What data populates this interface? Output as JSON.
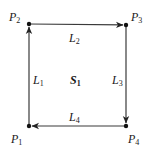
{
  "diagram": {
    "type": "directed-cycle",
    "region": {
      "name": "S",
      "sub": "1",
      "x": 77,
      "y": 80
    },
    "points": [
      {
        "id": "P1",
        "name": "P",
        "sub": "1",
        "x": 29,
        "y": 126,
        "label_x": 11,
        "label_y": 143
      },
      {
        "id": "P2",
        "name": "P",
        "sub": "2",
        "x": 29,
        "y": 24,
        "label_x": 9,
        "label_y": 21
      },
      {
        "id": "P3",
        "name": "P",
        "sub": "3",
        "x": 126,
        "y": 25,
        "label_x": 131,
        "label_y": 21
      },
      {
        "id": "P4",
        "name": "P",
        "sub": "4",
        "x": 126,
        "y": 126,
        "label_x": 128,
        "label_y": 143
      }
    ],
    "edges": [
      {
        "id": "L1",
        "name": "L",
        "sub": "1",
        "from": "P1",
        "to": "P2",
        "label_x": 33,
        "label_y": 84
      },
      {
        "id": "L2",
        "name": "L",
        "sub": "2",
        "from": "P2",
        "to": "P3",
        "label_x": 69,
        "label_y": 42
      },
      {
        "id": "L3",
        "name": "L",
        "sub": "3",
        "from": "P3",
        "to": "P4",
        "label_x": 112,
        "label_y": 84
      },
      {
        "id": "L4",
        "name": "L",
        "sub": "4",
        "from": "P4",
        "to": "P1",
        "label_x": 69,
        "label_y": 121
      }
    ],
    "colors": {
      "line": "#3a3a3a",
      "text": "#1a1a1a",
      "point": "#111111"
    }
  }
}
